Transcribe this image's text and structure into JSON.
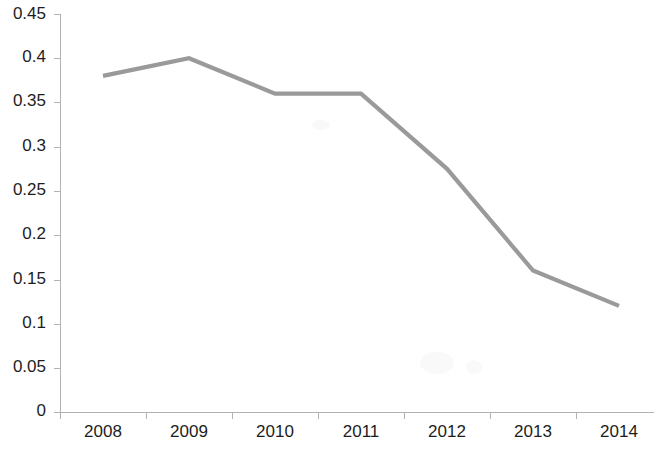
{
  "chart_data": {
    "type": "line",
    "title": "",
    "subtitle": "",
    "xlabel": "",
    "ylabel": "",
    "categories": [
      "2008",
      "2009",
      "2010",
      "2011",
      "2012",
      "2013",
      "2014"
    ],
    "values": [
      0.38,
      0.4,
      0.36,
      0.36,
      0.275,
      0.16,
      0.12
    ],
    "series": [
      {
        "name": "",
        "values": [
          0.38,
          0.4,
          0.36,
          0.36,
          0.275,
          0.16,
          0.12
        ]
      }
    ],
    "ylim": [
      0,
      0.45
    ],
    "ytick_labels": [
      "0",
      "0.05",
      "0.1",
      "0.15",
      "0.2",
      "0.25",
      "0.3",
      "0.35",
      "0.4",
      "0.45"
    ],
    "ytick_values": [
      0,
      0.05,
      0.1,
      0.15,
      0.2,
      0.25,
      0.3,
      0.35,
      0.4,
      0.45
    ],
    "xtick_labels": [
      "2008",
      "2009",
      "2010",
      "2011",
      "2012",
      "2013",
      "2014"
    ],
    "grid": false,
    "legend": false,
    "legend_position": "none",
    "markers": false,
    "line_color": "#9a9a9a",
    "axis_color": "#b2b2b2",
    "label_color": "#1d1d1d",
    "background_color": "#ffffff",
    "annotations": []
  }
}
